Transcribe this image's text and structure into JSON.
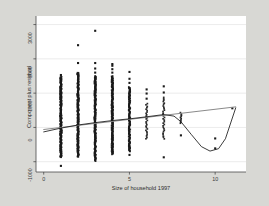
{
  "figure": {
    "background_color": "#d8d8d4",
    "plot_background_color": "#ffffff",
    "axis_color": "#4a4a4a",
    "grid_color": "#e2e2e2",
    "point_color": "#1a1a1a",
    "fit_line_color": "#8a8a8a",
    "lowess_line_color": "#1a1a1a"
  },
  "chart_data": {
    "type": "scatter",
    "title": "",
    "xlabel": "Size of household 1997",
    "ylabel": "Component plus residual",
    "xlim": [
      -0.45,
      11.8
    ],
    "ylim": [
      -1300,
      3250
    ],
    "xticks": [
      0,
      5,
      10
    ],
    "xticklabels": [
      "0",
      "5",
      "10"
    ],
    "yticks": [
      -1000,
      0,
      1000,
      2000,
      3000
    ],
    "yticklabels": [
      "-1000",
      "0",
      "1000",
      "2000",
      "3000"
    ],
    "grid": "horizontal",
    "legend": "none",
    "series": [
      {
        "name": "component plus residual points",
        "marker": "filled-square",
        "description": "Dense vertical columns of overplotted observations at each integer household size 1-11; density decreases sharply above size 5.",
        "columns": [
          {
            "x": 1,
            "n_dense": 260,
            "y_dense_min": -870,
            "y_dense_max": 1480,
            "outliers": [
              1530,
              -1120
            ]
          },
          {
            "x": 2,
            "n_dense": 240,
            "y_dense_min": -860,
            "y_dense_max": 1600,
            "outliers": [
              1880,
              2400
            ]
          },
          {
            "x": 3,
            "n_dense": 230,
            "y_dense_min": -980,
            "y_dense_max": 1500,
            "outliers": [
              1600,
              1720,
              1880,
              2820
            ]
          },
          {
            "x": 4,
            "n_dense": 215,
            "y_dense_min": -780,
            "y_dense_max": 1500,
            "outliers": [
              1600,
              1700,
              1800,
              1850
            ]
          },
          {
            "x": 5,
            "n_dense": 150,
            "y_dense_min": -700,
            "y_dense_max": 1180,
            "outliers": [
              1300,
              1420,
              1620,
              -800
            ]
          },
          {
            "x": 6,
            "n_dense": 26,
            "y_dense_min": -330,
            "y_dense_max": 700,
            "outliers": [
              840,
              990,
              1110
            ]
          },
          {
            "x": 7,
            "n_dense": 30,
            "y_dense_min": -330,
            "y_dense_max": 880,
            "outliers": [
              1020,
              1200,
              -870
            ]
          },
          {
            "x": 8,
            "n_dense": 10,
            "y_dense_min": 120,
            "y_dense_max": 430,
            "outliers": [
              -230
            ]
          },
          {
            "x": 10,
            "n_dense": 0,
            "y_dense_min": 0,
            "y_dense_max": 0,
            "outliers": [
              -320,
              -610
            ]
          },
          {
            "x": 11,
            "n_dense": 0,
            "y_dense_min": 0,
            "y_dense_max": 0,
            "outliers": [
              560
            ]
          }
        ]
      },
      {
        "name": "linear fit",
        "type": "line",
        "style": "solid",
        "color": "#8a8a8a",
        "x": [
          0,
          11.2
        ],
        "values": [
          -60,
          600
        ]
      },
      {
        "name": "lowess smooth",
        "type": "line",
        "style": "solid",
        "color": "#1a1a1a",
        "x": [
          0,
          1,
          2,
          3,
          4,
          5,
          6,
          7,
          7.6,
          8,
          8.6,
          9.2,
          9.7,
          10.2,
          10.6,
          11.2
        ],
        "values": [
          -130,
          -20,
          70,
          140,
          200,
          250,
          310,
          375,
          330,
          170,
          -200,
          -560,
          -690,
          -620,
          -330,
          570
        ]
      }
    ]
  },
  "axes": {
    "y_title": "Component plus residual",
    "x_title": "Size of household 1997"
  }
}
